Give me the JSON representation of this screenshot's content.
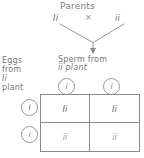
{
  "diagram": {
    "title": "Parents",
    "cross_symbol": "×",
    "parents": {
      "left_genotype": "Ii",
      "right_genotype": "ii"
    },
    "sperm_label": {
      "line1": "Sperm from",
      "line2": "ii plant"
    },
    "eggs_label": {
      "line1": "Eggs",
      "line2": "from",
      "line3": "Ii",
      "line4": "plant"
    },
    "gametes": {
      "columns": [
        "i",
        "i"
      ],
      "rows": [
        "I",
        "i"
      ]
    },
    "punnett_cells": [
      [
        "Ii",
        "Ii"
      ],
      [
        "ii",
        "ii"
      ]
    ],
    "colors": {
      "ink": "#7a7777",
      "line": "#8d8a8a",
      "background": "#ffffff"
    }
  }
}
